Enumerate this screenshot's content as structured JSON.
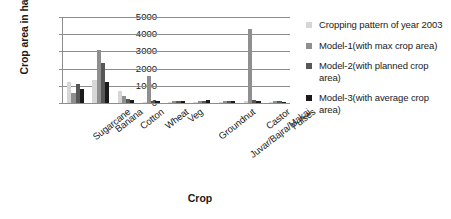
{
  "chart_data": {
    "type": "bar",
    "title": "",
    "xlabel": "Crop",
    "ylabel": "Crop area in ha",
    "ylim": [
      0,
      5000
    ],
    "yticks": [
      0,
      1000,
      2000,
      3000,
      4000,
      5000
    ],
    "ytick_labels": [
      "0",
      "1000",
      "2000",
      "3000",
      "4000",
      "5000"
    ],
    "grid": true,
    "legend_position": "right",
    "categories": [
      "Sugarcane",
      "Banana",
      "Cotton",
      "Wheat",
      "Veg",
      "Groundnut",
      "Juvar/Bajra/Makai",
      "Castor",
      "Pulses"
    ],
    "series": [
      {
        "name": "Cropping pattern of year 2003",
        "color": "#d6d6d6",
        "values": [
          1250,
          1350,
          700,
          80,
          60,
          60,
          80,
          90,
          70
        ]
      },
      {
        "name": "Model-1(with max crop area)",
        "color": "#8f8f8f",
        "values": [
          600,
          3100,
          420,
          1550,
          120,
          110,
          130,
          4300,
          110
        ]
      },
      {
        "name": "Model-2(with planned crop area)",
        "color": "#575757",
        "values": [
          1100,
          2300,
          260,
          110,
          100,
          90,
          110,
          150,
          95
        ]
      },
      {
        "name": "Model-3(with average crop area)",
        "color": "#1a1a1a",
        "values": [
          820,
          1200,
          150,
          95,
          90,
          200,
          130,
          120,
          85
        ]
      }
    ]
  }
}
